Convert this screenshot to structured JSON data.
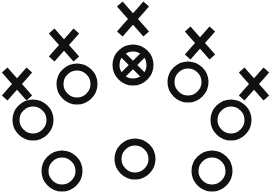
{
  "figure": {
    "background_color": "#ffffff",
    "stroke_color": "#111111",
    "width": 270,
    "height": 196
  },
  "markers": {
    "circles": [
      {
        "name": "circle-upper-left",
        "label": "O",
        "cx": 77,
        "cy": 84,
        "r": 17
      },
      {
        "name": "circle-mid-left",
        "label": "O",
        "cx": 33,
        "cy": 120,
        "r": 17
      },
      {
        "name": "circle-lower-left",
        "label": "O",
        "cx": 62,
        "cy": 171,
        "r": 17
      },
      {
        "name": "circle-bottom-center",
        "label": "O",
        "cx": 135,
        "cy": 159,
        "r": 17
      },
      {
        "name": "circle-lower-right",
        "label": "O",
        "cx": 212,
        "cy": 171,
        "r": 17
      },
      {
        "name": "circle-mid-right",
        "label": "O",
        "cx": 231,
        "cy": 120,
        "r": 17
      },
      {
        "name": "circle-upper-right",
        "label": "O",
        "cx": 188,
        "cy": 82,
        "r": 17
      }
    ],
    "crossed_circles": [
      {
        "name": "crossed-circle-top-center",
        "label": "circle-with-x",
        "cx": 133,
        "cy": 65,
        "r": 17
      }
    ],
    "crosses": [
      {
        "name": "x-top-center",
        "label": "X",
        "cx": 133,
        "cy": 19,
        "size": 15
      },
      {
        "name": "x-upper-left",
        "label": "X",
        "cx": 64,
        "cy": 45,
        "size": 14
      },
      {
        "name": "x-far-left",
        "label": "X",
        "cx": 17,
        "cy": 84,
        "size": 14
      },
      {
        "name": "x-upper-right",
        "label": "X",
        "cx": 200,
        "cy": 43,
        "size": 14
      },
      {
        "name": "x-far-right",
        "label": "X",
        "cx": 254,
        "cy": 84,
        "size": 14
      }
    ]
  }
}
